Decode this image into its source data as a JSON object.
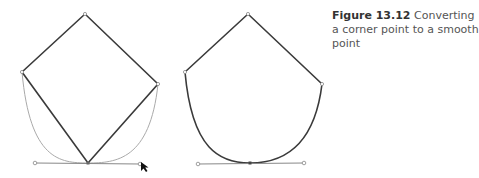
{
  "caption": {
    "label": "Figure 13.12",
    "text": "Converting a corner point to a smooth point"
  },
  "colors": {
    "path": "#3a3a3a",
    "guide": "#aaaaaa",
    "handle": "#888888",
    "caption_label": "#333333",
    "caption_text": "#555555"
  },
  "figures": [
    {
      "name": "corner-point-before",
      "anchors": {
        "top": [
          85,
          14
        ],
        "left": [
          22,
          72
        ],
        "right": [
          158,
          84
        ],
        "bottom": [
          88,
          163
        ]
      },
      "handles": {
        "left": [
          35,
          163
        ],
        "right": [
          140,
          164
        ]
      },
      "cursor": [
        141,
        163
      ]
    },
    {
      "name": "smooth-point-after",
      "anchors": {
        "top": [
          248,
          14
        ],
        "left": [
          185,
          72
        ],
        "right": [
          322,
          84
        ],
        "bottom": [
          250,
          163
        ]
      },
      "handles": {
        "left": [
          198,
          164
        ],
        "right": [
          304,
          163
        ]
      }
    }
  ]
}
